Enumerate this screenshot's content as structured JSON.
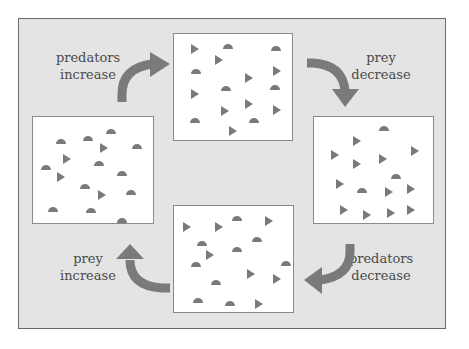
{
  "diagram": {
    "colors": {
      "background": "#e4e4e4",
      "frame_border": "#6a6a6a",
      "panel": "#ffffff",
      "shape": "#7a7a7a",
      "arrow": "#7a7a7a",
      "text": "#4a4a4a"
    },
    "legend_shapes": {
      "predator": "semicircle",
      "prey": "triangle"
    },
    "labels": {
      "top_left": [
        "predators",
        "increase"
      ],
      "top_right": [
        "prey",
        "decrease"
      ],
      "bottom_right": [
        "predators",
        "decrease"
      ],
      "bottom_left": [
        "prey",
        "increase"
      ]
    },
    "panels": [
      {
        "id": "top",
        "state": "many predators, many prey",
        "semicircles": [
          [
            54,
            12
          ],
          [
            102,
            14
          ],
          [
            22,
            37
          ],
          [
            52,
            54
          ],
          [
            101,
            53
          ],
          [
            21,
            86
          ],
          [
            80,
            86
          ]
        ],
        "triangles": [
          [
            20,
            15
          ],
          [
            44,
            26
          ],
          [
            74,
            44
          ],
          [
            102,
            37
          ],
          [
            20,
            60
          ],
          [
            50,
            77
          ],
          [
            74,
            70
          ],
          [
            102,
            76
          ],
          [
            58,
            97
          ]
        ]
      },
      {
        "id": "right",
        "state": "many predators, few prey",
        "semicircles": [
          [
            70,
            11
          ],
          [
            82,
            59
          ],
          [
            48,
            73
          ]
        ],
        "triangles": [
          [
            42,
            24
          ],
          [
            20,
            38
          ],
          [
            100,
            34
          ],
          [
            42,
            47
          ],
          [
            68,
            42
          ],
          [
            25,
            67
          ],
          [
            74,
            75
          ],
          [
            96,
            72
          ],
          [
            29,
            93
          ],
          [
            52,
            98
          ],
          [
            76,
            96
          ],
          [
            96,
            93
          ]
        ]
      },
      {
        "id": "bottom",
        "state": "few predators, few prey",
        "semicircles": [
          [
            63,
            12
          ],
          [
            28,
            37
          ],
          [
            83,
            33
          ],
          [
            63,
            43
          ],
          [
            22,
            58
          ],
          [
            112,
            57
          ],
          [
            42,
            76
          ],
          [
            24,
            94
          ],
          [
            56,
            97
          ]
        ],
        "triangles": [
          [
            12,
            21
          ],
          [
            44,
            21
          ],
          [
            94,
            15
          ],
          [
            35,
            49
          ],
          [
            76,
            68
          ],
          [
            102,
            73
          ],
          [
            84,
            98
          ]
        ]
      },
      {
        "id": "left",
        "state": "few predators, many prey",
        "semicircles": [
          [
            78,
            14
          ],
          [
            28,
            24
          ],
          [
            55,
            21
          ],
          [
            104,
            29
          ],
          [
            13,
            50
          ],
          [
            66,
            46
          ],
          [
            89,
            56
          ],
          [
            52,
            69
          ],
          [
            98,
            75
          ],
          [
            20,
            92
          ],
          [
            58,
            93
          ],
          [
            89,
            103
          ]
        ],
        "triangles": [
          [
            70,
            31
          ],
          [
            33,
            42
          ],
          [
            27,
            60
          ],
          [
            68,
            78
          ]
        ]
      }
    ]
  }
}
